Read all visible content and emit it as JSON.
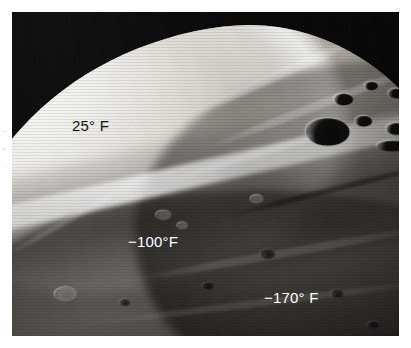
{
  "page": {
    "background_color": "#ffffff",
    "width": 411,
    "height": 348
  },
  "photo": {
    "name": "phobos-surface-photograph",
    "description": "Grayscale spacecraft photograph of an irregular cratered moon with a brilliantly sunlit limb arcing across the upper left and dark grooved cratered terrain in the lower right",
    "frame": {
      "left": 12,
      "top": 12,
      "width": 387,
      "height": 324
    },
    "background_color": "#040404",
    "highlight_color": "#f2f0ec",
    "shadow_color": "#0a0909"
  },
  "annotations": {
    "title": "Surface temperature annotations",
    "labels": [
      {
        "id": "label-25",
        "name": "temperature-label-sunlit-limb",
        "text": "25° F",
        "value": 25,
        "unit": "°F",
        "color": "#141414",
        "region": "sunlit crescent",
        "x": 72,
        "y": 118
      },
      {
        "id": "label-100",
        "name": "temperature-label-terminator",
        "text": "−100°F",
        "value": -100,
        "unit": "°F",
        "color": "#ffffff",
        "region": "shadowed ridge / terminator",
        "x": 128,
        "y": 234
      },
      {
        "id": "label-170",
        "name": "temperature-label-night-side",
        "text": "−170° F",
        "value": -170,
        "unit": "°F",
        "color": "#ffffff",
        "region": "dark cratered terrain",
        "x": 264,
        "y": 290
      }
    ]
  },
  "surface_features": {
    "grooves": [
      {
        "left": "44%",
        "top": "16%",
        "width": "34%",
        "height": "2.0%",
        "rotate": "-24deg",
        "color": "rgba(255,255,255,.28)"
      },
      {
        "left": "48%",
        "top": "22%",
        "width": "40%",
        "height": "1.6%",
        "rotate": "-21deg",
        "color": "rgba(255,255,255,.22)"
      },
      {
        "left": "40%",
        "top": "30%",
        "width": "46%",
        "height": "1.4%",
        "rotate": "-17deg",
        "color": "rgba(255,255,255,.18)"
      },
      {
        "left": "52%",
        "top": "39%",
        "width": "38%",
        "height": "1.3%",
        "rotate": "-14deg",
        "color": "rgba(0,0,0,.40)"
      },
      {
        "left": "36%",
        "top": "52%",
        "width": "52%",
        "height": "1.6%",
        "rotate": "-10deg",
        "color": "rgba(255,255,255,.12)"
      },
      {
        "left": "30%",
        "top": "62%",
        "width": "58%",
        "height": "1.4%",
        "rotate": "-7deg",
        "color": "rgba(255,255,255,.10)"
      },
      {
        "left": "26%",
        "top": "71%",
        "width": "60%",
        "height": "1.3%",
        "rotate": "-4deg",
        "color": "rgba(0,0,0,.35)"
      },
      {
        "left": "14%",
        "top": "44%",
        "width": "30%",
        "height": "1.2%",
        "rotate": "-30deg",
        "color": "rgba(255,255,255,.16)"
      }
    ],
    "craters": [
      {
        "type": "dark",
        "left": "70.5%",
        "top": "20.5%",
        "w": "3.2%",
        "h": "2.4%"
      },
      {
        "type": "dark",
        "left": "75.5%",
        "top": "18.0%",
        "w": "2.2%",
        "h": "1.7%"
      },
      {
        "type": "dark",
        "left": "79.5%",
        "top": "19.5%",
        "w": "2.6%",
        "h": "2.0%"
      },
      {
        "type": "dark",
        "left": "66.0%",
        "top": "25.5%",
        "w": "7.0%",
        "h": "5.4%"
      },
      {
        "type": "dark",
        "left": "74.0%",
        "top": "25.0%",
        "w": "2.8%",
        "h": "2.1%"
      },
      {
        "type": "dark",
        "left": "79.0%",
        "top": "26.5%",
        "w": "3.4%",
        "h": "2.4%"
      },
      {
        "type": "dark",
        "left": "83.0%",
        "top": "23.0%",
        "w": "2.4%",
        "h": "1.8%"
      },
      {
        "type": "dark",
        "left": "77.5%",
        "top": "30.0%",
        "w": "5.2%",
        "h": "2.2%"
      },
      {
        "type": "lit",
        "left": "25.0%",
        "top": "59.5%",
        "w": "3.6%",
        "h": "2.8%"
      },
      {
        "type": "lit",
        "left": "41.5%",
        "top": "44.0%",
        "w": "2.6%",
        "h": "1.9%"
      },
      {
        "type": "lit",
        "left": "45.0%",
        "top": "46.5%",
        "w": "1.8%",
        "h": "1.4%"
      },
      {
        "type": "lit",
        "left": "57.0%",
        "top": "41.0%",
        "w": "2.0%",
        "h": "1.6%"
      },
      {
        "type": "faint",
        "left": "20.0%",
        "top": "70.0%",
        "w": "3.0%",
        "h": "2.2%"
      },
      {
        "type": "faint",
        "left": "14.5%",
        "top": "75.5%",
        "w": "2.4%",
        "h": "1.8%"
      },
      {
        "type": "faint",
        "left": "27.0%",
        "top": "74.0%",
        "w": "2.2%",
        "h": "1.7%"
      },
      {
        "type": "faint",
        "left": "33.0%",
        "top": "79.0%",
        "w": "2.6%",
        "h": "1.9%"
      },
      {
        "type": "faint",
        "left": "40.0%",
        "top": "72.0%",
        "w": "2.0%",
        "h": "1.5%"
      },
      {
        "type": "faint",
        "left": "47.0%",
        "top": "76.0%",
        "w": "2.4%",
        "h": "1.8%"
      },
      {
        "type": "faint",
        "left": "53.0%",
        "top": "69.5%",
        "w": "1.8%",
        "h": "1.4%"
      },
      {
        "type": "faint",
        "left": "60.0%",
        "top": "73.5%",
        "w": "2.2%",
        "h": "1.6%"
      },
      {
        "type": "faint",
        "left": "66.0%",
        "top": "78.0%",
        "w": "2.0%",
        "h": "1.5%"
      },
      {
        "type": "faint",
        "left": "35.5%",
        "top": "62.0%",
        "w": "1.8%",
        "h": "1.4%"
      },
      {
        "type": "faint",
        "left": "49.0%",
        "top": "58.5%",
        "w": "2.0%",
        "h": "1.5%"
      },
      {
        "type": "faint",
        "left": "58.5%",
        "top": "52.0%",
        "w": "2.4%",
        "h": "1.8%"
      },
      {
        "type": "faint",
        "left": "70.0%",
        "top": "60.0%",
        "w": "2.2%",
        "h": "1.6%"
      },
      {
        "type": "faint",
        "left": "76.0%",
        "top": "66.5%",
        "w": "1.8%",
        "h": "1.4%"
      },
      {
        "type": "faint",
        "left": "22.5%",
        "top": "84.0%",
        "w": "2.6%",
        "h": "1.9%"
      },
      {
        "type": "faint",
        "left": "44.0%",
        "top": "86.0%",
        "w": "2.0%",
        "h": "1.5%"
      }
    ]
  }
}
